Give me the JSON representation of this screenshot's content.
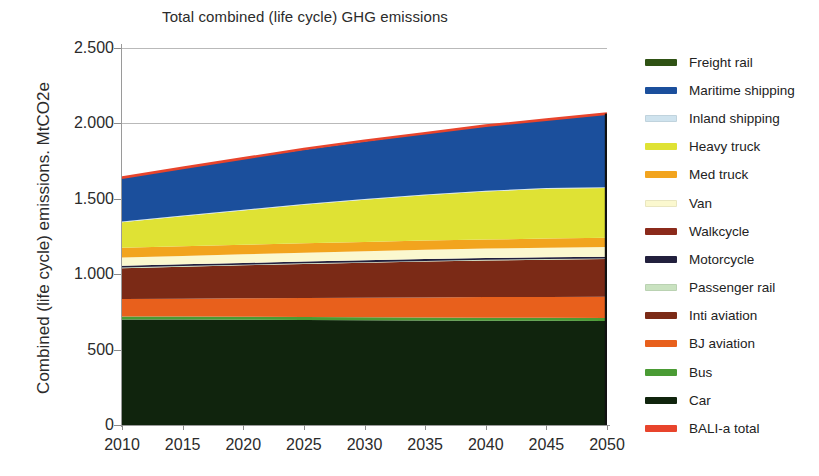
{
  "chart": {
    "title": "Total combined (life cycle) GHG emissions",
    "ylabel": "Combined (life cycle) emissions. MtCO2e"
  },
  "chart_data": {
    "type": "area",
    "title": "Total combined (life cycle) GHG emissions",
    "xlabel": "",
    "ylabel": "Combined (life cycle) emissions. MtCO2e",
    "x": [
      2010,
      2015,
      2020,
      2025,
      2030,
      2035,
      2040,
      2045,
      2050
    ],
    "xlim": [
      2010,
      2050
    ],
    "ylim": [
      0,
      2500
    ],
    "yticks": [
      0,
      500,
      1000,
      1500,
      2000,
      2500
    ],
    "ytick_labels": [
      "0",
      "500",
      "1.000",
      "1.500",
      "2.000",
      "2.500"
    ],
    "xtick_labels": [
      "2010",
      "2015",
      "2020",
      "2025",
      "2030",
      "2035",
      "2040",
      "2045",
      "2050"
    ],
    "grid": true,
    "legend_position": "right",
    "stacked": true,
    "stack_order_bottom_to_top": [
      "Car",
      "Bus",
      "BJ aviation",
      "Inti aviation",
      "Passenger rail",
      "Motorcycle",
      "Walkcycle",
      "Van",
      "Med truck",
      "Heavy truck",
      "Inland shipping",
      "Maritime shipping",
      "Freight rail"
    ],
    "series": [
      {
        "name": "Car",
        "color": "#10240d",
        "values": [
          700,
          700,
          698,
          696,
          694,
          693,
          692,
          691,
          690
        ]
      },
      {
        "name": "Bus",
        "color": "#4a9b34",
        "values": [
          20,
          20,
          20,
          20,
          20,
          20,
          20,
          20,
          20
        ]
      },
      {
        "name": "BJ aviation",
        "color": "#e8601c",
        "values": [
          115,
          118,
          122,
          126,
          130,
          133,
          136,
          138,
          140
        ]
      },
      {
        "name": "Inti aviation",
        "color": "#7b2a16",
        "values": [
          205,
          212,
          219,
          226,
          232,
          238,
          243,
          247,
          250
        ]
      },
      {
        "name": "Passenger rail",
        "color": "#c9e2c0",
        "values": [
          4,
          4,
          4,
          4,
          4,
          4,
          4,
          4,
          4
        ]
      },
      {
        "name": "Motorcycle",
        "color": "#22203d",
        "values": [
          12,
          12,
          12,
          12,
          12,
          12,
          12,
          12,
          12
        ]
      },
      {
        "name": "Walkcycle",
        "color": "#8b2a1b",
        "values": [
          0,
          0,
          0,
          0,
          0,
          0,
          0,
          0,
          0
        ]
      },
      {
        "name": "Van",
        "color": "#fbf8cf",
        "values": [
          54,
          55,
          57,
          59,
          60,
          62,
          63,
          64,
          65
        ]
      },
      {
        "name": "Med truck",
        "color": "#f2a41e",
        "values": [
          65,
          64,
          63,
          62,
          61,
          61,
          60,
          60,
          60
        ]
      },
      {
        "name": "Heavy truck",
        "color": "#dfe234",
        "values": [
          170,
          200,
          228,
          255,
          280,
          300,
          318,
          330,
          330
        ]
      },
      {
        "name": "Inland shipping",
        "color": "#cfe3ee",
        "values": [
          5,
          5,
          5,
          5,
          5,
          5,
          5,
          5,
          5
        ]
      },
      {
        "name": "Maritime shipping",
        "color": "#1b4f9c",
        "values": [
          295,
          315,
          338,
          360,
          382,
          405,
          428,
          455,
          489
        ]
      },
      {
        "name": "Freight rail",
        "color": "#2f5214",
        "values": [
          0,
          0,
          0,
          0,
          0,
          0,
          0,
          0,
          0
        ]
      }
    ],
    "total_line": {
      "name": "BALI-a total",
      "color": "#e8442c",
      "values": [
        1640,
        1705,
        1768,
        1830,
        1885,
        1935,
        1985,
        2025,
        2065
      ]
    },
    "stacked_top_boundaries_by_year": {
      "2010": {
        "Car": 700,
        "Bus": 720,
        "BJ aviation": 835,
        "Inti aviation": 1040,
        "Passenger rail": 1044,
        "Motorcycle": 1056,
        "Walkcycle": 1056,
        "Van": 1110,
        "Med truck": 1175,
        "Heavy truck": 1345,
        "Inland shipping": 1350,
        "Maritime shipping": 1640
      },
      "2050": {
        "Car": 690,
        "Bus": 710,
        "BJ aviation": 850,
        "Inti aviation": 1100,
        "Passenger rail": 1104,
        "Motorcycle": 1116,
        "Walkcycle": 1116,
        "Van": 1181,
        "Med truck": 1241,
        "Heavy truck": 1571,
        "Inland shipping": 1576,
        "Maritime shipping": 2065
      }
    }
  },
  "legend": {
    "items": [
      {
        "label": "Freight rail",
        "color": "#2f5214"
      },
      {
        "label": "Maritime shipping",
        "color": "#1b4f9c"
      },
      {
        "label": "Inland shipping",
        "color": "#cfe3ee"
      },
      {
        "label": "Heavy truck",
        "color": "#dfe234"
      },
      {
        "label": "Med truck",
        "color": "#f2a41e"
      },
      {
        "label": "Van",
        "color": "#fbf8cf"
      },
      {
        "label": "Walkcycle",
        "color": "#8b2a1b"
      },
      {
        "label": "Motorcycle",
        "color": "#22203d"
      },
      {
        "label": "Passenger rail",
        "color": "#c9e2c0"
      },
      {
        "label": "Inti aviation",
        "color": "#7b2a16"
      },
      {
        "label": "BJ aviation",
        "color": "#e8601c"
      },
      {
        "label": "Bus",
        "color": "#4a9b34"
      },
      {
        "label": "Car",
        "color": "#10240d"
      },
      {
        "label": "BALI-a total",
        "color": "#e8442c"
      }
    ]
  }
}
